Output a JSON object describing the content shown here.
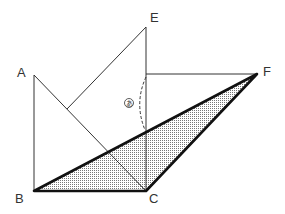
{
  "diagram": {
    "type": "geometry",
    "points": {
      "A": {
        "label": "A",
        "x": 34,
        "y": 75
      },
      "B": {
        "label": "B",
        "x": 34,
        "y": 191
      },
      "C": {
        "label": "C",
        "x": 146,
        "y": 191
      },
      "E": {
        "label": "E",
        "x": 146,
        "y": 27
      },
      "F": {
        "label": "F",
        "x": 257,
        "y": 74
      }
    },
    "angle_marker": {
      "label": "あ",
      "description": "angle between segment on EC and line BF"
    },
    "shaded_triangle": [
      "B",
      "C",
      "F"
    ],
    "colors": {
      "stroke": "#333333",
      "thick_stroke": "#111111",
      "shade": "#bbbbbb"
    }
  }
}
